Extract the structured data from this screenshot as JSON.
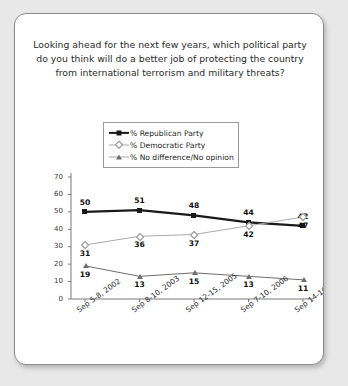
{
  "card": {
    "title": "Looking ahead for the next few years, which political party do you think will do a better job of protecting the country from international terrorism and military threats?"
  },
  "chart_data": {
    "type": "line",
    "title": "Looking ahead for the next few years, which political party do you think will do a better job of protecting the country from international terrorism and military threats?",
    "xlabel": "",
    "ylabel": "",
    "ylim": [
      0,
      70
    ],
    "yticks": [
      0,
      10,
      20,
      30,
      40,
      50,
      60,
      70
    ],
    "grid": false,
    "legend_position": "top-center",
    "categories": [
      "Sep 5-8, 2002",
      "Sep 8-10, 2003",
      "Sep 12-15, 2005",
      "Sep 7-10, 2006",
      "Sep 14-16, 2007"
    ],
    "series": [
      {
        "name": "% Republican Party",
        "marker": "filled-square",
        "color": "#1a1a1a",
        "values": [
          50,
          51,
          48,
          44,
          42
        ]
      },
      {
        "name": "% Democratic Party",
        "marker": "open-diamond",
        "color": "#aaaaaa",
        "values": [
          31,
          36,
          37,
          42,
          47
        ]
      },
      {
        "name": "% No difference/No opinion",
        "marker": "filled-triangle",
        "color": "#6e6e6e",
        "values": [
          19,
          13,
          15,
          13,
          11
        ]
      }
    ]
  }
}
